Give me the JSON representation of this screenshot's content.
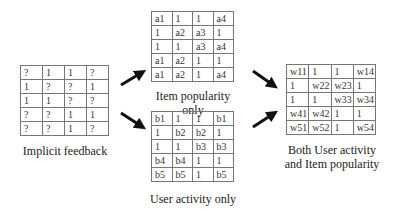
{
  "implicit": {
    "caption": "Implicit feedback",
    "rows": [
      [
        "?",
        "1",
        "1",
        "?"
      ],
      [
        "1",
        "?",
        "?",
        "1"
      ],
      [
        "1",
        "1",
        "?",
        "?"
      ],
      [
        "?",
        "?",
        "1",
        "1"
      ],
      [
        "?",
        "?",
        "1",
        "?"
      ]
    ]
  },
  "item_popularity": {
    "caption": "Item popularity only",
    "rows": [
      [
        "a1",
        "1",
        "1",
        "a4"
      ],
      [
        "1",
        "a2",
        "a3",
        "1"
      ],
      [
        "1",
        "1",
        "a3",
        "a4"
      ],
      [
        "a1",
        "a2",
        "1",
        "1"
      ],
      [
        "a1",
        "a2",
        "1",
        "a4"
      ]
    ]
  },
  "user_activity": {
    "caption": "User activity only",
    "rows": [
      [
        "b1",
        "1",
        "1",
        "b1"
      ],
      [
        "1",
        "b2",
        "b2",
        "1"
      ],
      [
        "1",
        "1",
        "b3",
        "b3"
      ],
      [
        "b4",
        "b4",
        "1",
        "1"
      ],
      [
        "b5",
        "b5",
        "1",
        "b5"
      ]
    ]
  },
  "both": {
    "caption_line1": "Both User activity",
    "caption_line2": "and Item popularity",
    "rows": [
      [
        "w11",
        "1",
        "1",
        "w14"
      ],
      [
        "1",
        "w22",
        "w23",
        "1"
      ],
      [
        "1",
        "1",
        "w33",
        "w34"
      ],
      [
        "w41",
        "w42",
        "1",
        "1"
      ],
      [
        "w51",
        "w52",
        "1",
        "w54"
      ]
    ]
  },
  "arrows": {
    "color": "#111111",
    "items": [
      "implicit-to-item-popularity",
      "implicit-to-user-activity",
      "item-popularity-to-both",
      "user-activity-to-both"
    ]
  }
}
